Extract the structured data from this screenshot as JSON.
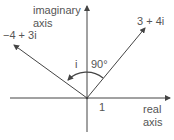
{
  "diagram": {
    "axes": {
      "imaginary_label_line1": "imaginary",
      "imaginary_label_line2": "axis",
      "real_label_line1": "real",
      "real_label_line2": "axis",
      "unit_tick_label": "1"
    },
    "vectors": [
      {
        "label": "3 + 4i",
        "re": 3,
        "im": 4
      },
      {
        "label": "−4 + 3i",
        "re": -4,
        "im": 3
      }
    ],
    "rotation": {
      "multiplier_label": "i",
      "angle_label": "90°"
    },
    "colors": {
      "line": "#444444",
      "text": "#555555",
      "background": "#ffffff"
    }
  }
}
